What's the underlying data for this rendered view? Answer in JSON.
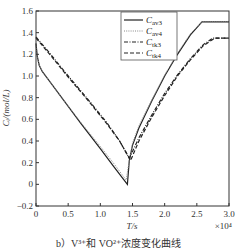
{
  "chart_data": {
    "type": "line",
    "title": "",
    "caption": "b）V³⁺和 VO²⁺浓度变化曲线",
    "xlabel": "T/s",
    "x_multiplier": "×10⁴",
    "ylabel": "Cᵢ/(mol/L)",
    "xlim": [
      0,
      3.0
    ],
    "ylim": [
      -0.2,
      1.6
    ],
    "xticks": [
      0,
      0.5,
      1.0,
      1.5,
      2.0,
      2.5,
      3.0
    ],
    "xtick_labels": [
      "0",
      "0.5",
      "1.0",
      "1.5",
      "2.0",
      "2.5",
      "3.0"
    ],
    "yticks": [
      -0.2,
      0,
      0.2,
      0.4,
      0.6,
      0.8,
      1.0,
      1.2,
      1.4,
      1.6
    ],
    "ytick_labels": [
      "-0.2",
      "0",
      "0.2",
      "0.4",
      "0.6",
      "0.8",
      "1.0",
      "1.2",
      "1.4",
      "1.6"
    ],
    "grid": false,
    "legend_position": "upper left",
    "series": [
      {
        "name": "Cav3",
        "label_main": "C",
        "label_sub": "av3",
        "style": "solid",
        "color": "#222222",
        "x": [
          0,
          0.02,
          0.05,
          0.1,
          0.2,
          0.4,
          0.7,
          1.0,
          1.2,
          1.42,
          1.45,
          1.5,
          1.6,
          1.8,
          2.0,
          2.2,
          2.4,
          2.58,
          3.0
        ],
        "y": [
          1.3,
          1.18,
          1.1,
          1.04,
          0.96,
          0.8,
          0.56,
          0.33,
          0.17,
          0.0,
          0.22,
          0.36,
          0.52,
          0.77,
          1.0,
          1.2,
          1.38,
          1.5,
          1.5
        ]
      },
      {
        "name": "Cav4",
        "label_main": "C",
        "label_sub": "av4",
        "style": "dotted",
        "color": "#888888",
        "x": [
          0,
          0.02,
          0.05,
          0.1,
          0.2,
          0.4,
          0.7,
          1.0,
          1.2,
          1.4,
          1.45,
          1.5,
          1.6,
          1.8,
          2.0,
          2.2,
          2.4,
          2.58,
          3.0
        ],
        "y": [
          1.3,
          1.18,
          1.1,
          1.04,
          0.96,
          0.8,
          0.57,
          0.35,
          0.2,
          0.04,
          0.22,
          0.38,
          0.54,
          0.78,
          1.01,
          1.21,
          1.39,
          1.5,
          1.5
        ]
      },
      {
        "name": "Ctk3",
        "label_main": "C",
        "label_sub": "tk3",
        "style": "dashdot",
        "color": "#222222",
        "x": [
          0,
          0.2,
          0.5,
          0.8,
          1.1,
          1.3,
          1.45,
          1.6,
          1.8,
          2.0,
          2.2,
          2.4,
          2.6,
          2.75,
          3.0
        ],
        "y": [
          1.36,
          1.22,
          1.0,
          0.79,
          0.57,
          0.4,
          0.24,
          0.43,
          0.64,
          0.84,
          1.01,
          1.16,
          1.29,
          1.35,
          1.35
        ]
      },
      {
        "name": "Ctk4",
        "label_main": "C",
        "label_sub": "tk4",
        "style": "dashed",
        "color": "#222222",
        "x": [
          0,
          0.2,
          0.5,
          0.8,
          1.1,
          1.3,
          1.47,
          1.6,
          1.8,
          2.0,
          2.2,
          2.4,
          2.6,
          2.78,
          3.0
        ],
        "y": [
          1.35,
          1.21,
          0.99,
          0.78,
          0.56,
          0.4,
          0.22,
          0.4,
          0.62,
          0.82,
          1.0,
          1.15,
          1.28,
          1.35,
          1.35
        ]
      }
    ]
  }
}
